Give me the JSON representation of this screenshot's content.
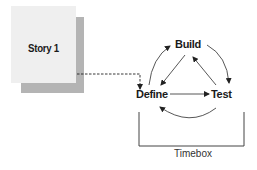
{
  "story_card": {
    "label": "Story 1",
    "front_color": "#efefef",
    "shadow_color": "#b4b4b4"
  },
  "cycle": {
    "nodes": [
      {
        "id": "build",
        "label": "Build"
      },
      {
        "id": "define",
        "label": "Define"
      },
      {
        "id": "test",
        "label": "Test"
      }
    ],
    "edges": [
      {
        "from": "define",
        "to": "build",
        "style": "curved"
      },
      {
        "from": "build",
        "to": "test",
        "style": "curved"
      },
      {
        "from": "test",
        "to": "define",
        "style": "curved"
      },
      {
        "from": "build",
        "to": "define",
        "style": "straight"
      },
      {
        "from": "define",
        "to": "test",
        "style": "straight"
      },
      {
        "from": "test",
        "to": "build",
        "style": "straight"
      }
    ]
  },
  "connector": {
    "from": "story_card",
    "to": "define",
    "style": "dashed"
  },
  "timebox": {
    "label": "Timebox"
  }
}
